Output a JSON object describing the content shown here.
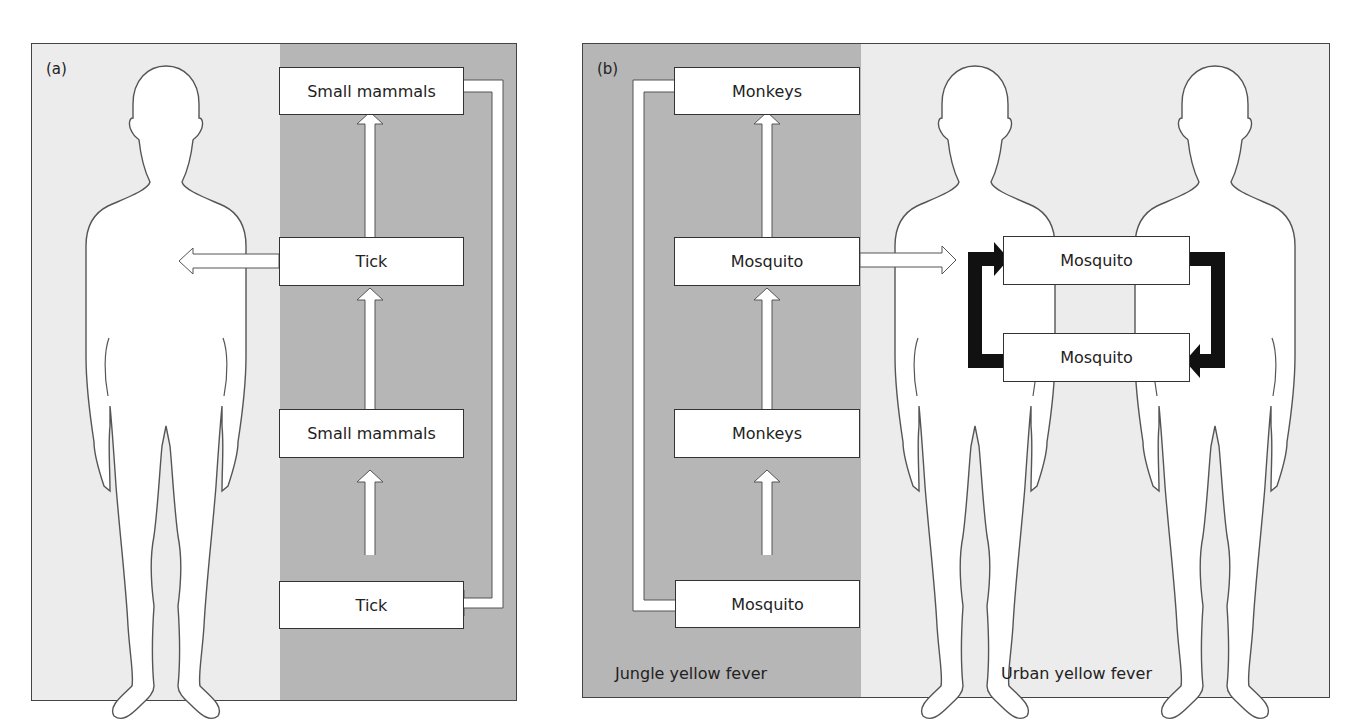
{
  "panels": {
    "a": {
      "label": "(a)",
      "boxes": [
        {
          "id": "small-mammals-top",
          "text": "Small mammals"
        },
        {
          "id": "tick-middle",
          "text": "Tick"
        },
        {
          "id": "small-mammals-lower",
          "text": "Small mammals"
        },
        {
          "id": "tick-bottom",
          "text": "Tick"
        }
      ]
    },
    "b": {
      "label": "(b)",
      "boxes": [
        {
          "id": "monkeys-top",
          "text": "Monkeys"
        },
        {
          "id": "mosquito-jungle-middle",
          "text": "Mosquito"
        },
        {
          "id": "monkeys-lower",
          "text": "Monkeys"
        },
        {
          "id": "mosquito-jungle-bottom",
          "text": "Mosquito"
        },
        {
          "id": "mosquito-urban-top",
          "text": "Mosquito"
        },
        {
          "id": "mosquito-urban-bottom",
          "text": "Mosquito"
        }
      ],
      "captions": {
        "jungle": "Jungle yellow fever",
        "urban": "Urban yellow fever"
      }
    }
  },
  "colors": {
    "background_light": "#ececec",
    "background_dark": "#b6b6b6",
    "box_fill": "#ffffff",
    "outline": "#333333",
    "cycle_arrow": "#111111"
  }
}
